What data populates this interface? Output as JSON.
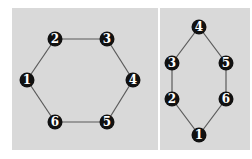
{
  "colors": {
    "background": "#ffffff",
    "panel": "#d9d9d9",
    "edge": "#5a5a5a",
    "node_fill": "#111111",
    "node_text": "#ffffff"
  },
  "graphs": [
    {
      "name": "hexagon-graph",
      "panel": {
        "x": 12,
        "y": 8,
        "w": 146,
        "h": 142
      },
      "nodes": [
        {
          "id": "1",
          "label": "1",
          "x": 27,
          "y": 80
        },
        {
          "id": "2",
          "label": "2",
          "x": 55,
          "y": 39
        },
        {
          "id": "3",
          "label": "3",
          "x": 107,
          "y": 39
        },
        {
          "id": "4",
          "label": "4",
          "x": 133,
          "y": 80
        },
        {
          "id": "5",
          "label": "5",
          "x": 107,
          "y": 122
        },
        {
          "id": "6",
          "label": "6",
          "x": 55,
          "y": 122
        }
      ],
      "edges": [
        [
          "1",
          "2"
        ],
        [
          "2",
          "3"
        ],
        [
          "3",
          "4"
        ],
        [
          "4",
          "5"
        ],
        [
          "5",
          "6"
        ],
        [
          "6",
          "1"
        ]
      ]
    },
    {
      "name": "elongated-hexagon-graph",
      "panel": {
        "x": 160,
        "y": 8,
        "w": 90,
        "h": 142
      },
      "nodes": [
        {
          "id": "4",
          "label": "4",
          "x": 199,
          "y": 27
        },
        {
          "id": "3",
          "label": "3",
          "x": 172,
          "y": 63
        },
        {
          "id": "5",
          "label": "5",
          "x": 226,
          "y": 63
        },
        {
          "id": "2",
          "label": "2",
          "x": 172,
          "y": 99
        },
        {
          "id": "6",
          "label": "6",
          "x": 226,
          "y": 99
        },
        {
          "id": "1",
          "label": "1",
          "x": 199,
          "y": 135
        }
      ],
      "edges": [
        [
          "4",
          "3"
        ],
        [
          "3",
          "2"
        ],
        [
          "2",
          "1"
        ],
        [
          "1",
          "6"
        ],
        [
          "6",
          "5"
        ],
        [
          "5",
          "4"
        ]
      ]
    }
  ]
}
